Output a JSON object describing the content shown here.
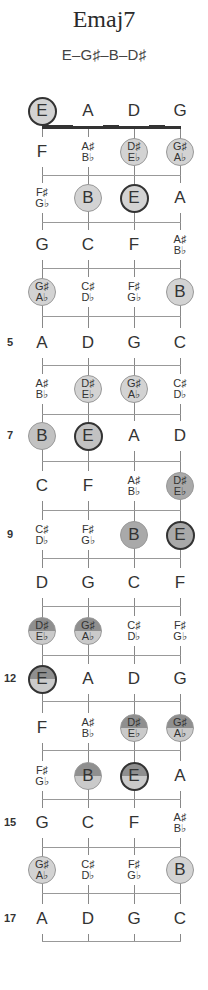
{
  "chord": {
    "title": "Emaj7",
    "formula": "E–G♯–B–D♯"
  },
  "fretboard": {
    "strings": [
      "E",
      "A",
      "D",
      "G"
    ],
    "string_x": [
      42,
      88,
      134,
      180
    ],
    "nut_y": 127,
    "top_y": 127,
    "bottom_y": 941,
    "fret_lines_y": [
      175,
      222,
      268,
      316,
      365,
      414,
      461,
      510,
      558,
      606,
      655,
      701,
      750,
      799,
      847,
      893,
      941
    ],
    "fret_numbers": [
      {
        "fret": 5,
        "label": "5",
        "y": 343
      },
      {
        "fret": 7,
        "label": "7",
        "y": 436
      },
      {
        "fret": 9,
        "label": "9",
        "y": 535
      },
      {
        "fret": 12,
        "label": "12",
        "y": 679
      },
      {
        "fret": 15,
        "label": "15",
        "y": 823
      },
      {
        "fret": 17,
        "label": "17",
        "y": 919
      }
    ],
    "rows": [
      {
        "fret": 0,
        "y": 111,
        "notes": [
          {
            "sharp": "E",
            "marked": true,
            "root": true,
            "shade": "light"
          },
          {
            "sharp": "A"
          },
          {
            "sharp": "D"
          },
          {
            "sharp": "G"
          }
        ]
      },
      {
        "fret": 1,
        "y": 152,
        "notes": [
          {
            "sharp": "F"
          },
          {
            "sharp": "A♯",
            "flat": "B♭"
          },
          {
            "sharp": "D♯",
            "flat": "E♭",
            "marked": true,
            "shade": "light"
          },
          {
            "sharp": "G♯",
            "flat": "A♭",
            "marked": true,
            "shade": "light"
          }
        ]
      },
      {
        "fret": 2,
        "y": 198,
        "notes": [
          {
            "sharp": "F♯",
            "flat": "G♭"
          },
          {
            "sharp": "B",
            "marked": true,
            "shade": "light"
          },
          {
            "sharp": "E",
            "marked": true,
            "root": true,
            "shade": "light"
          },
          {
            "sharp": "A"
          }
        ]
      },
      {
        "fret": 3,
        "y": 245,
        "notes": [
          {
            "sharp": "G"
          },
          {
            "sharp": "C"
          },
          {
            "sharp": "F"
          },
          {
            "sharp": "A♯",
            "flat": "B♭"
          }
        ]
      },
      {
        "fret": 4,
        "y": 292,
        "notes": [
          {
            "sharp": "G♯",
            "flat": "A♭",
            "marked": true,
            "shade": "light"
          },
          {
            "sharp": "C♯",
            "flat": "D♭"
          },
          {
            "sharp": "F♯",
            "flat": "G♭"
          },
          {
            "sharp": "B",
            "marked": true,
            "shade": "light"
          }
        ]
      },
      {
        "fret": 5,
        "y": 343,
        "notes": [
          {
            "sharp": "A"
          },
          {
            "sharp": "D"
          },
          {
            "sharp": "G"
          },
          {
            "sharp": "C"
          }
        ]
      },
      {
        "fret": 6,
        "y": 389,
        "notes": [
          {
            "sharp": "A♯",
            "flat": "B♭"
          },
          {
            "sharp": "D♯",
            "flat": "E♭",
            "marked": true,
            "shade": "light"
          },
          {
            "sharp": "G♯",
            "flat": "A♭",
            "marked": true,
            "shade": "light"
          },
          {
            "sharp": "C♯",
            "flat": "D♭"
          }
        ]
      },
      {
        "fret": 7,
        "y": 436,
        "notes": [
          {
            "sharp": "B",
            "marked": true,
            "shade": "midlight"
          },
          {
            "sharp": "E",
            "marked": true,
            "root": true,
            "shade": "midlight"
          },
          {
            "sharp": "A"
          },
          {
            "sharp": "D"
          }
        ]
      },
      {
        "fret": 8,
        "y": 486,
        "notes": [
          {
            "sharp": "C"
          },
          {
            "sharp": "F"
          },
          {
            "sharp": "A♯",
            "flat": "B♭"
          },
          {
            "sharp": "D♯",
            "flat": "E♭",
            "marked": true,
            "shade": "mid"
          }
        ]
      },
      {
        "fret": 9,
        "y": 535,
        "notes": [
          {
            "sharp": "C♯",
            "flat": "D♭"
          },
          {
            "sharp": "F♯",
            "flat": "G♭"
          },
          {
            "sharp": "B",
            "marked": true,
            "shade": "mid"
          },
          {
            "sharp": "E",
            "marked": true,
            "root": true,
            "shade": "mid"
          }
        ]
      },
      {
        "fret": 10,
        "y": 583,
        "notes": [
          {
            "sharp": "D"
          },
          {
            "sharp": "G"
          },
          {
            "sharp": "C"
          },
          {
            "sharp": "F"
          }
        ]
      },
      {
        "fret": 11,
        "y": 631,
        "notes": [
          {
            "sharp": "D♯",
            "flat": "E♭",
            "marked": true,
            "shade": "split"
          },
          {
            "sharp": "G♯",
            "flat": "A♭",
            "marked": true,
            "shade": "split"
          },
          {
            "sharp": "C♯",
            "flat": "D♭"
          },
          {
            "sharp": "F♯",
            "flat": "G♭"
          }
        ]
      },
      {
        "fret": 12,
        "y": 679,
        "notes": [
          {
            "sharp": "E",
            "marked": true,
            "root": true,
            "shade": "split"
          },
          {
            "sharp": "A"
          },
          {
            "sharp": "D"
          },
          {
            "sharp": "G"
          }
        ]
      },
      {
        "fret": 13,
        "y": 728,
        "notes": [
          {
            "sharp": "F"
          },
          {
            "sharp": "A♯",
            "flat": "B♭"
          },
          {
            "sharp": "D♯",
            "flat": "E♭",
            "marked": true,
            "shade": "split"
          },
          {
            "sharp": "G♯",
            "flat": "A♭",
            "marked": true,
            "shade": "split"
          }
        ]
      },
      {
        "fret": 14,
        "y": 776,
        "notes": [
          {
            "sharp": "F♯",
            "flat": "G♭"
          },
          {
            "sharp": "B",
            "marked": true,
            "shade": "split"
          },
          {
            "sharp": "E",
            "marked": true,
            "root": true,
            "shade": "split"
          },
          {
            "sharp": "A"
          }
        ]
      },
      {
        "fret": 15,
        "y": 823,
        "notes": [
          {
            "sharp": "G"
          },
          {
            "sharp": "C"
          },
          {
            "sharp": "F"
          },
          {
            "sharp": "A♯",
            "flat": "B♭"
          }
        ]
      },
      {
        "fret": 16,
        "y": 870,
        "notes": [
          {
            "sharp": "G♯",
            "flat": "A♭",
            "marked": true,
            "shade": "light"
          },
          {
            "sharp": "C♯",
            "flat": "D♭"
          },
          {
            "sharp": "F♯",
            "flat": "G♭"
          },
          {
            "sharp": "B",
            "marked": true,
            "shade": "light"
          }
        ]
      },
      {
        "fret": 17,
        "y": 919,
        "notes": [
          {
            "sharp": "A"
          },
          {
            "sharp": "D"
          },
          {
            "sharp": "G"
          },
          {
            "sharp": "C"
          }
        ]
      }
    ]
  },
  "colors": {
    "light": "#d3d3d3",
    "midlight": "#c2c2c2",
    "mid": "#a9a9a9",
    "split_top": "#8f8f8f",
    "split_bottom": "#cacaca",
    "root_border": "#333333"
  }
}
